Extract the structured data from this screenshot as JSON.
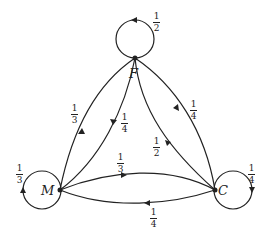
{
  "diagram": {
    "type": "markov-chain",
    "nodes": [
      {
        "id": "F",
        "label": "F",
        "x": 135,
        "y": 58
      },
      {
        "id": "M",
        "label": "M",
        "x": 60,
        "y": 190
      },
      {
        "id": "C",
        "label": "C",
        "x": 215,
        "y": 190
      }
    ],
    "edges": [
      {
        "from": "F",
        "to": "F",
        "num": "1",
        "den": "2"
      },
      {
        "from": "M",
        "to": "M",
        "num": "1",
        "den": "3"
      },
      {
        "from": "C",
        "to": "C",
        "num": "1",
        "den": "4"
      },
      {
        "from": "M",
        "to": "F",
        "num": "1",
        "den": "3"
      },
      {
        "from": "F",
        "to": "M",
        "num": "1",
        "den": "4"
      },
      {
        "from": "F",
        "to": "C",
        "num": "1",
        "den": "4"
      },
      {
        "from": "C",
        "to": "F",
        "num": "1",
        "den": "2"
      },
      {
        "from": "M",
        "to": "C",
        "num": "1",
        "den": "3"
      },
      {
        "from": "C",
        "to": "M",
        "num": "1",
        "den": "4"
      }
    ],
    "stroke_color": "#222222"
  }
}
